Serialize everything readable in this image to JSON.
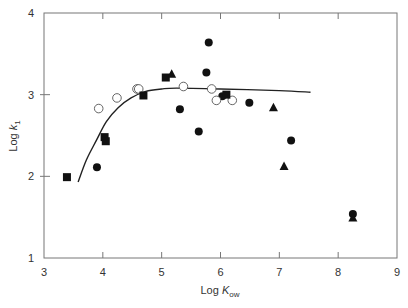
{
  "chart_data": {
    "type": "scatter",
    "title": "",
    "xlabel": "Log K_ow",
    "xlabel_main": "Log ",
    "xlabel_var": "K",
    "xlabel_sub": "ow",
    "ylabel": "Log k_1",
    "ylabel_main": "Log ",
    "ylabel_var": "k",
    "ylabel_sub": "1",
    "xlim": [
      3,
      9
    ],
    "ylim": [
      1,
      4
    ],
    "xticks": [
      "3",
      "4",
      "5",
      "6",
      "7",
      "8",
      "9"
    ],
    "yticks": [
      "1",
      "2",
      "3",
      "4"
    ],
    "grid": false,
    "legend": "none",
    "series": [
      {
        "name": "filled-circle",
        "marker": "circle-filled",
        "points": [
          [
            3.9,
            2.11
          ],
          [
            5.31,
            2.82
          ],
          [
            5.8,
            3.64
          ],
          [
            5.76,
            3.27
          ],
          [
            5.63,
            2.55
          ],
          [
            6.03,
            2.98
          ],
          [
            6.49,
            2.9
          ],
          [
            7.2,
            2.44
          ],
          [
            8.25,
            1.54
          ]
        ]
      },
      {
        "name": "open-circle",
        "marker": "circle-open",
        "points": [
          [
            3.93,
            2.83
          ],
          [
            4.24,
            2.96
          ],
          [
            4.58,
            3.07
          ],
          [
            4.61,
            3.07
          ],
          [
            5.37,
            3.1
          ],
          [
            5.85,
            3.07
          ],
          [
            5.93,
            2.93
          ],
          [
            6.2,
            2.93
          ]
        ]
      },
      {
        "name": "filled-square",
        "marker": "square-filled",
        "points": [
          [
            3.39,
            1.99
          ],
          [
            4.03,
            2.48
          ],
          [
            4.05,
            2.43
          ],
          [
            4.69,
            2.99
          ],
          [
            5.07,
            3.21
          ],
          [
            6.1,
            3.0
          ]
        ]
      },
      {
        "name": "filled-triangle",
        "marker": "triangle-filled",
        "points": [
          [
            5.17,
            3.25
          ],
          [
            6.9,
            2.84
          ],
          [
            7.08,
            2.12
          ],
          [
            8.25,
            1.49
          ]
        ]
      }
    ],
    "fit_curve": {
      "name": "fitted-curve",
      "points": [
        [
          3.58,
          1.93
        ],
        [
          3.72,
          2.2
        ],
        [
          3.89,
          2.44
        ],
        [
          4.06,
          2.67
        ],
        [
          4.26,
          2.84
        ],
        [
          4.48,
          2.96
        ],
        [
          4.73,
          3.04
        ],
        [
          5.0,
          3.07
        ],
        [
          5.25,
          3.08
        ],
        [
          6.0,
          3.07
        ],
        [
          7.0,
          3.05
        ],
        [
          7.53,
          3.03
        ]
      ]
    }
  }
}
